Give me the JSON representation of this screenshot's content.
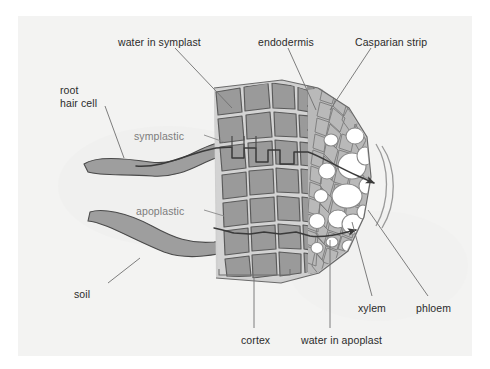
{
  "figure": {
    "domain": "diagram",
    "panel_background": "#f3f3f2",
    "page_background": "#ffffff"
  },
  "palette": {
    "label_text": "#2b2b2b",
    "pathway_text": "#7c7c7c",
    "leader_line": "#6f6f6f",
    "cortex_fill": "#9a9a9a",
    "cortex_outline": "#5c5c5c",
    "cell_wall": "#cfcfcf",
    "stele_fill": "#b9b9b9",
    "stele_outline": "#7b7b7b",
    "vessel_fill": "#ffffff",
    "root_hair_fill": "#9e9e9e",
    "pathway_line": "#3a3a3a",
    "bracket": "#6f6f6f",
    "endodermis_band": "#8d8d8d",
    "casparian_strip": "#b0b0b0"
  },
  "labels": [
    {
      "id": "water-in-symplast",
      "text": "water in symplast",
      "x": 118,
      "y": 36,
      "style": "dark",
      "align": "left"
    },
    {
      "id": "endodermis",
      "text": "endodermis",
      "x": 258,
      "y": 36,
      "style": "dark",
      "align": "left"
    },
    {
      "id": "casparian-strip",
      "text": "Casparian strip",
      "x": 355,
      "y": 36,
      "style": "dark",
      "align": "left"
    },
    {
      "id": "root-hair-cell",
      "text": "root\nhair cell",
      "x": 60,
      "y": 84,
      "style": "dark",
      "align": "left"
    },
    {
      "id": "symplastic",
      "text": "symplastic",
      "x": 134,
      "y": 130,
      "style": "gray",
      "align": "left"
    },
    {
      "id": "apoplastic",
      "text": "apoplastic",
      "x": 136,
      "y": 205,
      "style": "gray",
      "align": "left"
    },
    {
      "id": "soil",
      "text": "soil",
      "x": 74,
      "y": 288,
      "style": "dark",
      "align": "left"
    },
    {
      "id": "cortex",
      "text": "cortex",
      "x": 241,
      "y": 334,
      "style": "dark",
      "align": "left"
    },
    {
      "id": "water-in-apoplast",
      "text": "water in apoplast",
      "x": 301,
      "y": 334,
      "style": "dark",
      "align": "left"
    },
    {
      "id": "xylem",
      "text": "xylem",
      "x": 358,
      "y": 302,
      "style": "dark",
      "align": "left"
    },
    {
      "id": "phloem",
      "text": "phloem",
      "x": 416,
      "y": 302,
      "style": "dark",
      "align": "left"
    }
  ],
  "leader_lines": [
    {
      "id": "leader-water-in-symplast",
      "from": [
        175,
        48
      ],
      "to": [
        232,
        108
      ]
    },
    {
      "id": "leader-endodermis",
      "from": [
        288,
        48
      ],
      "to": [
        316,
        110
      ]
    },
    {
      "id": "leader-casparian-strip",
      "from": [
        371,
        48
      ],
      "to": [
        330,
        110
      ]
    },
    {
      "id": "leader-root-hair-cell",
      "from": [
        105,
        106
      ],
      "to": [
        124,
        158
      ]
    },
    {
      "id": "leader-soil",
      "from": [
        108,
        283
      ],
      "to": [
        140,
        258
      ]
    },
    {
      "id": "leader-xylem",
      "from": [
        372,
        296
      ],
      "to": [
        352,
        222
      ]
    },
    {
      "id": "leader-phloem",
      "from": [
        428,
        296
      ],
      "to": [
        368,
        210
      ]
    },
    {
      "id": "leader-water-in-apoplast",
      "from": [
        330,
        328
      ],
      "to": [
        330,
        240
      ]
    },
    {
      "id": "leader-cortex-stem",
      "from": [
        254,
        328
      ],
      "to": [
        254,
        277
      ]
    }
  ],
  "brackets": [
    {
      "id": "cortex-bracket",
      "x1": 219,
      "x2": 290,
      "y": 275,
      "tick": 6
    }
  ],
  "pathway_arrows": [
    {
      "id": "symplastic-arrow",
      "label": "symplastic",
      "tip": [
        358,
        168
      ]
    },
    {
      "id": "apoplastic-arrow",
      "label": "apoplastic",
      "tip": [
        340,
        215
      ]
    }
  ],
  "structures": [
    {
      "id": "root-hair-upper",
      "name": "upper root hair cell"
    },
    {
      "id": "root-hair-lower",
      "name": "lower root hair cell"
    },
    {
      "id": "cortex-tissue",
      "name": "cortex cell layers"
    },
    {
      "id": "endodermis-layer",
      "name": "endodermis layer"
    },
    {
      "id": "casparian-band",
      "name": "Casparian strip band"
    },
    {
      "id": "stele-tissue",
      "name": "stele / vascular tissue"
    },
    {
      "id": "xylem-vessels",
      "name": "xylem vessels"
    },
    {
      "id": "phloem-arcs",
      "name": "phloem arcs"
    }
  ]
}
